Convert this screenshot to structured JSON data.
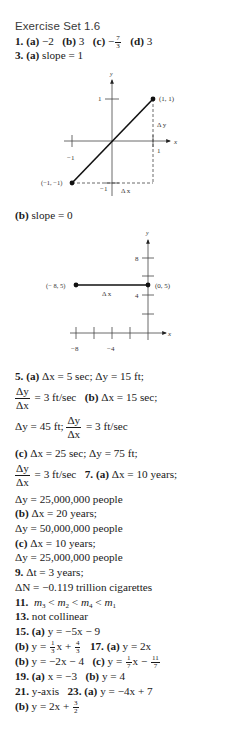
{
  "title": "Exercise Set 1.6",
  "ex1": {
    "num": "1.",
    "a": "(a)",
    "a_val": "−2",
    "b": "(b)",
    "b_val": "3",
    "c": "(c)",
    "c_sign": "−",
    "c_num": "7",
    "c_den": "3",
    "d": "(d)",
    "d_val": "3"
  },
  "ex3": {
    "num": "3.",
    "a": "(a)",
    "a_val": "slope = 1",
    "b": "(b)",
    "b_val": "slope = 0"
  },
  "graph1": {
    "y_label": "y",
    "x_label": "x",
    "tick_y_pos": "1",
    "tick_y_neg": "−1",
    "tick_x_pos": "1",
    "tick_x_neg": "−1",
    "point_a": "(1, 1)",
    "point_b": "(−1, −1)",
    "delta_y": "Δ y",
    "delta_x": "Δ x"
  },
  "graph2": {
    "y_label": "y",
    "x_label": "x",
    "tick_y_8": "8",
    "tick_y_4": "4",
    "tick_x_m8": "−8",
    "tick_x_m4": "−4",
    "point_a": "(− 8, 5)",
    "point_b": "(0, 5)",
    "delta_x": "Δ x"
  },
  "ex5": {
    "num": "5.",
    "a": "(a)",
    "a_text": "Δx = 5 sec; Δy = 15 ft;",
    "frac_num": "Δy",
    "frac_den": "Δx",
    "a_rate": "= 3 ft/sec",
    "b": "(b)",
    "b_text": "Δx = 15 sec;",
    "b_dy": "Δy = 45 ft;",
    "b_rate": "= 3 ft/sec",
    "c": "(c)",
    "c_text": "Δx = 25 sec; Δy = 75 ft;",
    "c_rate": "= 3 ft/sec"
  },
  "ex7": {
    "num": "7.",
    "a": "(a)",
    "a_text": "Δx = 10 years;",
    "a_dy": "Δy = 25,000,000 people",
    "b": "(b)",
    "b_text": "Δx = 20 years;",
    "b_dy": "Δy = 50,000,000 people",
    "c": "(c)",
    "c_text": "Δx = 10 years;",
    "c_dy": "Δy = 25,000,000 people"
  },
  "ex9": {
    "num": "9.",
    "text": "Δt = 3 years;",
    "text2": "ΔN = −0.119 trillion cigarettes"
  },
  "ex11": {
    "num": "11."
  },
  "ex13": {
    "num": "13.",
    "text": "not collinear"
  },
  "ex15": {
    "num": "15.",
    "a": "(a)",
    "a_text": "y = −5x − 9",
    "b": "(b)",
    "b_pre": "y =",
    "b_f1n": "1",
    "b_f1d": "3",
    "b_mid": "x +",
    "b_f2n": "4",
    "b_f2d": "3"
  },
  "ex17": {
    "num": "17.",
    "a": "(a)",
    "a_text": "y = 2x",
    "b": "(b)",
    "b_text": "y = −2x − 4",
    "c": "(c)",
    "c_pre": "y =",
    "c_f1n": "1",
    "c_f1d": "7",
    "c_mid": "x −",
    "c_f2n": "11",
    "c_f2d": "7"
  },
  "ex19": {
    "num": "19.",
    "a": "(a)",
    "a_text": "x = −3",
    "b": "(b)",
    "b_text": "y = 4"
  },
  "ex21": {
    "num": "21.",
    "text": "y-axis"
  },
  "ex23": {
    "num": "23.",
    "a": "(a)",
    "a_text": "y = −4x + 7",
    "b": "(b)",
    "b_pre": "y = 2x +",
    "b_fn": "3",
    "b_fd": "2"
  }
}
